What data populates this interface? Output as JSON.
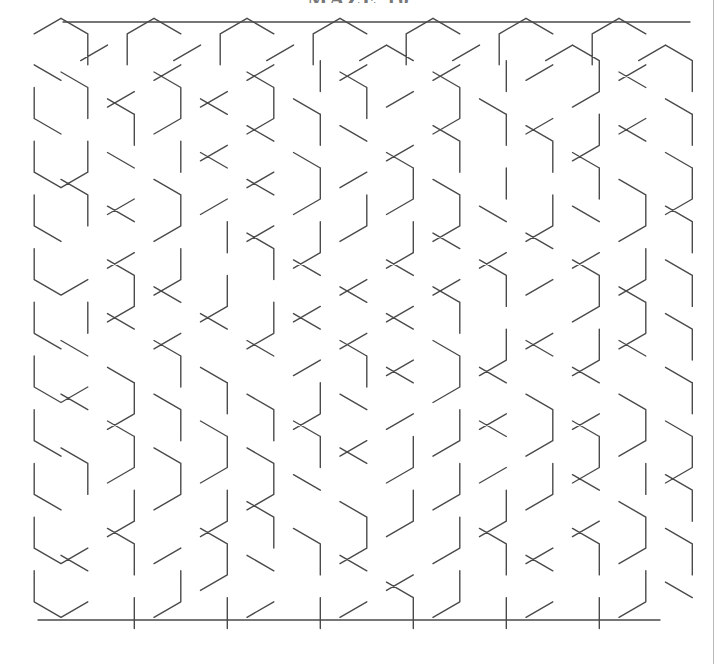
{
  "page": {
    "width": 718,
    "height": 664,
    "background_color": "#ffffff",
    "edge_line_color": "#b9b9b9"
  },
  "title": {
    "text": "MAZE 10",
    "color": "#777777",
    "clipped_at_top": true
  },
  "maze": {
    "name": "hexagonal-maze",
    "line_color": "#4a4a4a",
    "line_width": 1.4,
    "cell_shape": "hexagon",
    "orientation": "pointy-top-flat-left",
    "origin_x": 30,
    "origin_y": 22,
    "hex_radius": 31,
    "col_pitch": 46.5,
    "row_pitch": 53.7,
    "columns": 14,
    "rows": 11,
    "entrance": {
      "label": "top-left-gap",
      "col": 0,
      "row": 0
    },
    "exit": {
      "label": "bottom-right-gap",
      "col": 13,
      "row": 10
    },
    "bounds": {
      "left": 30,
      "top": 22,
      "right": 690,
      "bottom": 626
    }
  },
  "chart_data": {
    "type": "maze",
    "title": "MAZE 10",
    "grid": "hexagonal",
    "seed": 101074,
    "wall_probability": 0.5
  }
}
